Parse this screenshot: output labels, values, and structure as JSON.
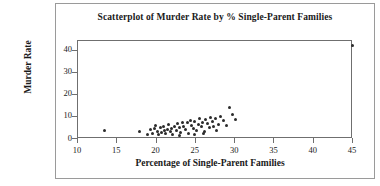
{
  "chart_data": {
    "type": "scatter",
    "title": "Scatterplot of Murder Rate by % Single-Parent Families",
    "xlabel": "Percentage of Single-Parent Families",
    "ylabel": "Murder Rate",
    "xlim": [
      10,
      45
    ],
    "ylim": [
      0,
      44.4
    ],
    "xticks": [
      10,
      15,
      20,
      25,
      30,
      35,
      40,
      45
    ],
    "yticks": [
      0,
      10,
      20,
      30,
      40
    ],
    "grid": false,
    "legend": null,
    "marker_color": "#2b2b2b",
    "frame_color": "#6f6f6f",
    "points": [
      [
        13.5,
        3.5
      ],
      [
        18.0,
        3.0
      ],
      [
        19.6,
        2.0
      ],
      [
        19.8,
        4.2
      ],
      [
        20.0,
        5.6
      ],
      [
        20.2,
        3.0
      ],
      [
        20.4,
        1.6
      ],
      [
        20.6,
        4.6
      ],
      [
        20.8,
        2.4
      ],
      [
        21.0,
        5.2
      ],
      [
        21.1,
        3.4
      ],
      [
        21.3,
        2.0
      ],
      [
        21.5,
        4.0
      ],
      [
        21.7,
        6.0
      ],
      [
        21.9,
        2.8
      ],
      [
        22.0,
        4.4
      ],
      [
        22.2,
        1.8
      ],
      [
        22.4,
        5.0
      ],
      [
        22.6,
        3.2
      ],
      [
        22.8,
        6.4
      ],
      [
        23.0,
        4.8
      ],
      [
        23.2,
        2.6
      ],
      [
        23.4,
        7.2
      ],
      [
        23.6,
        5.4
      ],
      [
        23.8,
        3.8
      ],
      [
        24.0,
        6.8
      ],
      [
        24.2,
        2.2
      ],
      [
        24.4,
        8.0
      ],
      [
        24.6,
        5.8
      ],
      [
        24.8,
        4.2
      ],
      [
        25.0,
        7.6
      ],
      [
        25.2,
        3.6
      ],
      [
        25.4,
        6.2
      ],
      [
        25.6,
        9.0
      ],
      [
        25.8,
        5.0
      ],
      [
        26.0,
        7.0
      ],
      [
        26.2,
        3.0
      ],
      [
        26.4,
        8.4
      ],
      [
        26.6,
        6.6
      ],
      [
        26.8,
        4.6
      ],
      [
        27.0,
        9.4
      ],
      [
        27.2,
        7.4
      ],
      [
        27.4,
        5.4
      ],
      [
        27.6,
        8.8
      ],
      [
        27.8,
        3.4
      ],
      [
        28.0,
        6.0
      ],
      [
        28.3,
        9.8
      ],
      [
        28.6,
        7.8
      ],
      [
        29.0,
        5.6
      ],
      [
        29.4,
        14.0
      ],
      [
        29.8,
        10.6
      ],
      [
        30.2,
        8.2
      ],
      [
        19.0,
        1.4
      ],
      [
        19.3,
        3.8
      ],
      [
        23.1,
        1.2
      ],
      [
        24.9,
        1.6
      ],
      [
        26.1,
        2.0
      ],
      [
        45.0,
        42.0
      ]
    ]
  }
}
